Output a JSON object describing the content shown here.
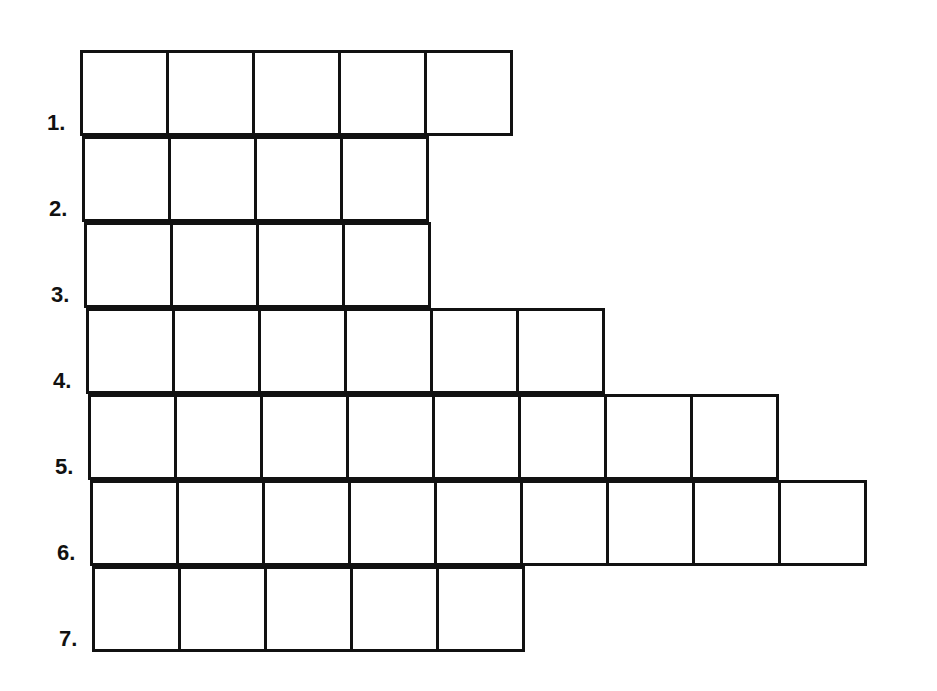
{
  "puzzle": {
    "line_color": "#111111",
    "rows": [
      {
        "label": "1.",
        "cells": 5
      },
      {
        "label": "2.",
        "cells": 4
      },
      {
        "label": "3.",
        "cells": 4
      },
      {
        "label": "4.",
        "cells": 6
      },
      {
        "label": "5.",
        "cells": 8
      },
      {
        "label": "6.",
        "cells": 9
      },
      {
        "label": "7.",
        "cells": 5
      }
    ]
  }
}
